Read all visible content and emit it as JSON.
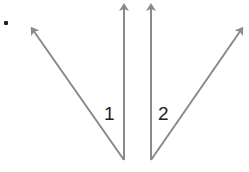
{
  "diagram": {
    "stroke_color": "#8a8a8a",
    "text_color": "#222222",
    "angles": [
      {
        "label": "1",
        "vertex": [
          124,
          160
        ],
        "ray_a": [
          31,
          27
        ],
        "ray_b": [
          124,
          4
        ]
      },
      {
        "label": "2",
        "vertex": [
          151,
          160
        ],
        "ray_a": [
          151,
          4
        ],
        "ray_b": [
          243,
          27
        ]
      }
    ],
    "partial_mark": "."
  }
}
